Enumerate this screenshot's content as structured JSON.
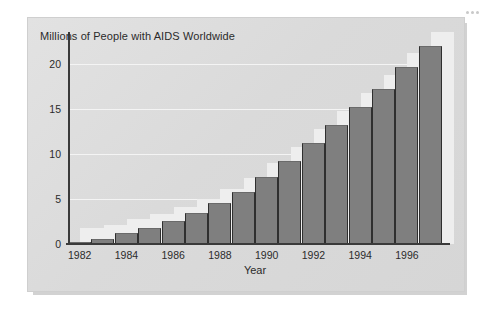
{
  "chart_data": {
    "type": "bar",
    "title": "Millions of People with AIDS Worldwide",
    "xlabel": "Year",
    "ylabel": "",
    "categories": [
      "1982",
      "1983",
      "1984",
      "1985",
      "1986",
      "1987",
      "1988",
      "1989",
      "1990",
      "1991",
      "1992",
      "1993",
      "1994",
      "1995",
      "1996",
      "1997"
    ],
    "values": [
      0.2,
      0.6,
      1.2,
      1.8,
      2.6,
      3.4,
      4.6,
      5.8,
      7.4,
      9.2,
      11.2,
      13.2,
      15.2,
      17.2,
      19.6,
      22.0
    ],
    "x_tick_labels": [
      "1982",
      "1984",
      "1986",
      "1988",
      "1990",
      "1992",
      "1994",
      "1996"
    ],
    "y_tick_labels": [
      "0",
      "5",
      "10",
      "15",
      "20"
    ],
    "y_ticks": [
      0,
      5,
      10,
      15,
      20
    ],
    "ylim": [
      0,
      23.5
    ],
    "grid": "horizontal-white",
    "legend": "none",
    "series_color": "#7f7f7f",
    "ghost_color": "#eeeeee",
    "panel_color": "#dcdcdc",
    "axis_color": "#3a3a3a"
  },
  "decoration": {
    "corner_dots_count": 3
  }
}
